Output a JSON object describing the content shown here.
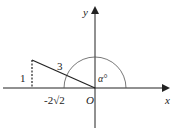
{
  "diagram": {
    "axes": {
      "x_label": "x",
      "y_label": "y",
      "origin_label": "O"
    },
    "triangle": {
      "vertical_side_label": "1",
      "hypotenuse_label": "3",
      "horizontal_side_label": "-2√2"
    },
    "angle": {
      "label": "α°"
    },
    "colors": {
      "line": "#222222",
      "arc": "#555555"
    }
  }
}
